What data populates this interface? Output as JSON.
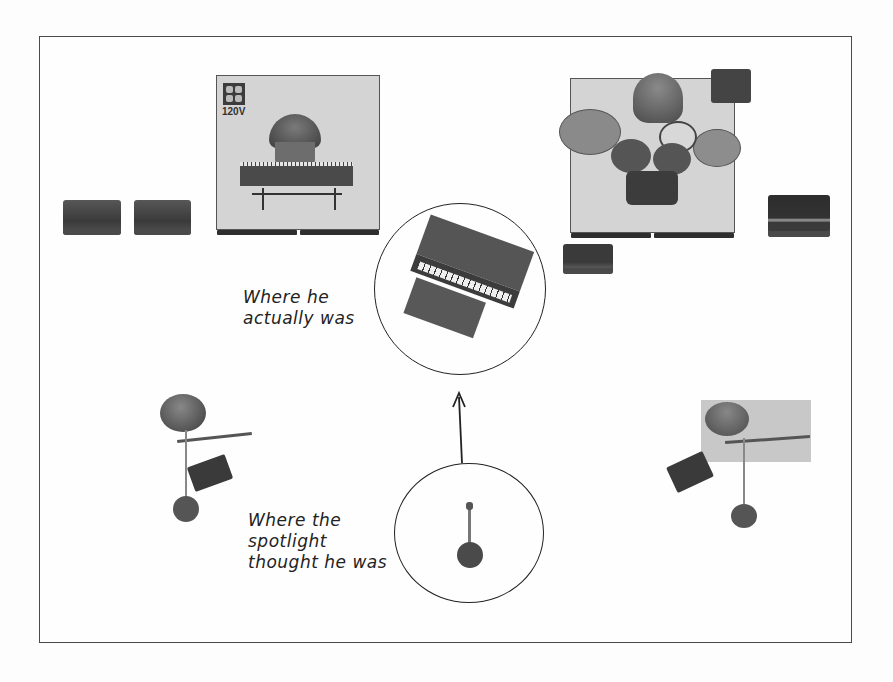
{
  "diagram": {
    "type": "stage-plot",
    "elements": {
      "keyboard_riser": {
        "power_label": "120V",
        "power_icon": "outlet-icon",
        "instrument": "keyboard player"
      },
      "drum_riser": {
        "instrument": "drum kit with drummer"
      },
      "left_amps": {
        "count": 2
      },
      "right_amp": {
        "count": 1
      },
      "small_amp": {
        "count": 1
      },
      "piano_circle": {
        "instrument": "upright piano"
      },
      "spotlight_circle": {
        "object": "mic stand"
      },
      "left_guitarist": {
        "instrument": "guitar with pedalboard and mic stand"
      },
      "right_guitarist": {
        "instrument": "guitar with pedalboard and mic stand"
      }
    },
    "annotations": {
      "actual": [
        "Where he",
        "actually was"
      ],
      "spotlight": [
        "Where the",
        "spotlight",
        "thought he was"
      ]
    },
    "arrow": {
      "from": "spotlight_circle",
      "to": "piano_circle"
    },
    "colors": {
      "frame": "#4a4a4a",
      "riser": "#d4d4d4",
      "equipment": "#3f3f3f",
      "ink": "#222222"
    }
  }
}
